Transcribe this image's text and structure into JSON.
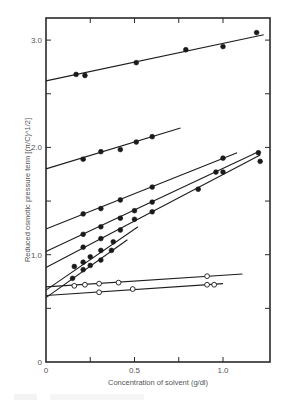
{
  "chart_data": {
    "type": "scatter",
    "title": "",
    "xlabel": "Concentration of solvent (g/dl)",
    "ylabel": "Reduced osmotic pressure term [(π/C)^1/2]",
    "xlim": [
      0,
      1.25
    ],
    "ylim": [
      0,
      3.2
    ],
    "grid": false,
    "legend": null,
    "x_ticks": [
      0,
      0.25,
      0.5,
      0.75,
      1.0
    ],
    "x_tick_labels": [
      "0",
      "",
      "0.5",
      "",
      "1.0"
    ],
    "y_ticks": [
      0,
      0.5,
      1.0,
      1.5,
      2.0,
      2.5,
      3.0
    ],
    "y_tick_labels": [
      "0",
      "",
      "1.0",
      "",
      "2.0",
      "",
      "3.0"
    ],
    "series": [
      {
        "name": "series-1",
        "marker": "filled",
        "points": [
          [
            0.17,
            2.68
          ],
          [
            0.22,
            2.67
          ],
          [
            0.51,
            2.79
          ],
          [
            0.79,
            2.91
          ],
          [
            1.0,
            2.94
          ],
          [
            1.19,
            3.07
          ]
        ],
        "fit": [
          [
            0,
            2.62
          ],
          [
            1.23,
            3.05
          ]
        ]
      },
      {
        "name": "series-2",
        "marker": "filled",
        "points": [
          [
            0.21,
            1.89
          ],
          [
            0.31,
            1.96
          ],
          [
            0.42,
            1.98
          ],
          [
            0.51,
            2.05
          ],
          [
            0.6,
            2.1
          ]
        ],
        "fit": [
          [
            0,
            1.8
          ],
          [
            0.76,
            2.18
          ]
        ]
      },
      {
        "name": "series-3",
        "marker": "filled",
        "points": [
          [
            0.21,
            1.38
          ],
          [
            0.31,
            1.43
          ],
          [
            0.42,
            1.51
          ],
          [
            0.6,
            1.63
          ],
          [
            1.0,
            1.9
          ]
        ],
        "fit": [
          [
            0,
            1.24
          ],
          [
            1.08,
            1.95
          ]
        ]
      },
      {
        "name": "series-4",
        "marker": "filled",
        "points": [
          [
            0.21,
            1.19
          ],
          [
            0.31,
            1.26
          ],
          [
            0.42,
            1.34
          ],
          [
            0.5,
            1.41
          ],
          [
            0.6,
            1.49
          ],
          [
            0.96,
            1.77
          ],
          [
            1.0,
            1.77
          ],
          [
            1.2,
            1.95
          ]
        ],
        "fit": [
          [
            0,
            1.03
          ],
          [
            1.2,
            1.96
          ]
        ]
      },
      {
        "name": "series-5",
        "marker": "filled",
        "points": [
          [
            0.21,
            1.07
          ],
          [
            0.31,
            1.15
          ],
          [
            0.42,
            1.23
          ],
          [
            0.5,
            1.33
          ],
          [
            0.6,
            1.4
          ],
          [
            0.86,
            1.61
          ],
          [
            1.21,
            1.87
          ]
        ],
        "fit": [
          [
            0,
            0.88
          ],
          [
            1.21,
            1.93
          ]
        ]
      },
      {
        "name": "series-6",
        "marker": "filled",
        "points": [
          [
            0.16,
            0.89
          ],
          [
            0.21,
            0.93
          ],
          [
            0.25,
            0.98
          ],
          [
            0.31,
            1.04
          ],
          [
            0.38,
            1.12
          ]
        ],
        "fit": [
          [
            0,
            0.67
          ],
          [
            0.52,
            1.26
          ]
        ]
      },
      {
        "name": "series-7",
        "marker": "filled",
        "points": [
          [
            0.15,
            0.78
          ],
          [
            0.21,
            0.86
          ],
          [
            0.25,
            0.9
          ],
          [
            0.31,
            0.95
          ],
          [
            0.37,
            1.04
          ]
        ],
        "fit": [
          [
            0,
            0.6
          ],
          [
            0.46,
            1.14
          ]
        ]
      },
      {
        "name": "series-8",
        "marker": "open",
        "points": [
          [
            0.16,
            0.71
          ],
          [
            0.22,
            0.72
          ],
          [
            0.3,
            0.73
          ],
          [
            0.41,
            0.74
          ],
          [
            0.91,
            0.8
          ]
        ],
        "fit": [
          [
            0,
            0.7
          ],
          [
            1.11,
            0.82
          ]
        ]
      },
      {
        "name": "series-9",
        "marker": "open",
        "points": [
          [
            0.3,
            0.65
          ],
          [
            0.49,
            0.68
          ],
          [
            0.91,
            0.72
          ],
          [
            0.95,
            0.72
          ]
        ],
        "fit": [
          [
            0,
            0.62
          ],
          [
            1.0,
            0.73
          ]
        ]
      }
    ]
  },
  "labels": {
    "xlabel": "Concentration of solvent (g/dl)",
    "ylabel": "Reduced osmotic pressure term [(π/C)^1/2]"
  }
}
